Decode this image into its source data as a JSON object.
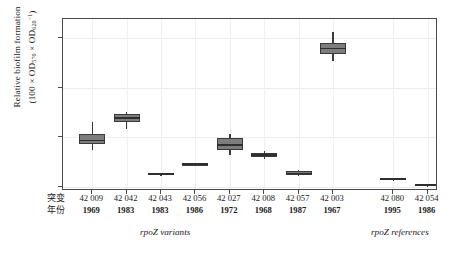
{
  "chart_data": {
    "type": "box",
    "title": "",
    "xlabel": "",
    "ylabel_line1": "Relative biofilm formation",
    "ylabel_line2_prefix": "(100 × OD",
    "ylabel_sub1": "570",
    "ylabel_mid": " × OD",
    "ylabel_sub2": "620",
    "ylabel_sup": "−1",
    "ylabel_suffix": ")",
    "ylim": [
      -15,
      675
    ],
    "yticks": [
      0,
      200,
      400,
      600
    ],
    "ytick_labels": [
      "0",
      "200",
      "400",
      "600"
    ],
    "grid": "horizontal and vertical light gridlines",
    "legend": "none",
    "row_header_cn": [
      "突变",
      "年份"
    ],
    "group_labels": [
      {
        "text": "rpoZ variants",
        "position": "left-center under axis"
      },
      {
        "text": "rpoZ references",
        "position": "right under axis"
      }
    ],
    "categories": [
      {
        "id": "42 009",
        "year": "1969",
        "group": "variants"
      },
      {
        "id": "42 042",
        "year": "1983",
        "group": "variants"
      },
      {
        "id": "42 043",
        "year": "1983",
        "group": "variants"
      },
      {
        "id": "42 056",
        "year": "1986",
        "group": "variants"
      },
      {
        "id": "42 027",
        "year": "1972",
        "group": "variants"
      },
      {
        "id": "42 008",
        "year": "1968",
        "group": "variants"
      },
      {
        "id": "42 057",
        "year": "1987",
        "group": "variants"
      },
      {
        "id": "42 003",
        "year": "1967",
        "group": "variants"
      },
      {
        "id": "42 080",
        "year": "1995",
        "group": "references"
      },
      {
        "id": "42 054",
        "year": "1986",
        "group": "references"
      }
    ],
    "boxes": [
      {
        "id": "42 009",
        "min": 150,
        "q1": 172,
        "median": 188,
        "q3": 215,
        "max": 262
      },
      {
        "id": "42 042",
        "min": 232,
        "q1": 262,
        "median": 278,
        "q3": 292,
        "max": 302
      },
      {
        "id": "42 043",
        "min": 48,
        "q1": 50,
        "median": 53,
        "q3": 56,
        "max": 58
      },
      {
        "id": "42 056",
        "min": 88,
        "q1": 90,
        "median": 93,
        "q3": 96,
        "max": 98
      },
      {
        "id": "42 027",
        "min": 128,
        "q1": 148,
        "median": 170,
        "q3": 196,
        "max": 212
      },
      {
        "id": "42 008",
        "min": 112,
        "q1": 122,
        "median": 130,
        "q3": 138,
        "max": 146
      },
      {
        "id": "42 057",
        "min": 44,
        "q1": 50,
        "median": 56,
        "q3": 64,
        "max": 70
      },
      {
        "id": "42 003",
        "min": 508,
        "q1": 536,
        "median": 556,
        "q3": 580,
        "max": 624
      },
      {
        "id": "42 080",
        "min": 28,
        "q1": 30,
        "median": 33,
        "q3": 36,
        "max": 38
      },
      {
        "id": "42 054",
        "min": 4,
        "q1": 6,
        "median": 9,
        "q3": 12,
        "max": 14
      }
    ]
  },
  "colors": {
    "box_fill": "#7d7d7d",
    "box_stroke": "#3a3a3a",
    "median": "#2e2e2e",
    "panel_border": "#4a4a4a",
    "grid": "#ececec",
    "background": "#ffffff"
  }
}
